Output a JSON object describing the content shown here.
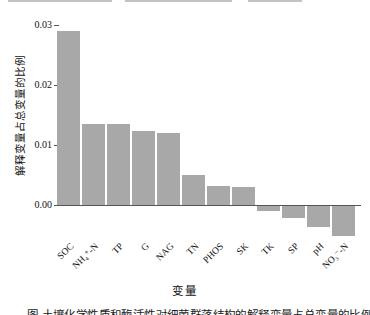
{
  "chart_data": {
    "type": "bar",
    "title": "",
    "categories": [
      "SOC",
      "NH₄⁺-N",
      "TP",
      "G",
      "NAG",
      "TN",
      "PHOS",
      "SK",
      "TK",
      "SP",
      "pH",
      "NO₃⁻-N"
    ],
    "values": [
      0.029,
      0.0135,
      0.0135,
      0.0123,
      0.012,
      0.005,
      0.0032,
      0.003,
      -0.0008,
      -0.002,
      -0.0035,
      -0.005
    ],
    "xlabel": "变量",
    "ylabel": "解释变量占总变量的比例",
    "yticks": [
      {
        "label": "0.03",
        "value": 0.03
      },
      {
        "label": "0.02",
        "value": 0.02
      },
      {
        "label": "0.01",
        "value": 0.01
      },
      {
        "label": "0.00",
        "value": 0.0
      }
    ],
    "ylim": [
      -0.006,
      0.031
    ],
    "grid": false,
    "legend_position": "none",
    "bar_color": "#a8a8a8",
    "axis_color": "#555555"
  },
  "caption_clipped": "图 土壤化学性质和酶活性对细菌群落结构的解释变量占总变量的比例",
  "layout": {
    "baseline_y": 205,
    "px_per_unit": 6000,
    "first_bar_left": 57,
    "bar_pitch": 25,
    "bar_width": 23,
    "axis_left": 54,
    "axis_right": 361,
    "xtick_label_top": 241
  }
}
